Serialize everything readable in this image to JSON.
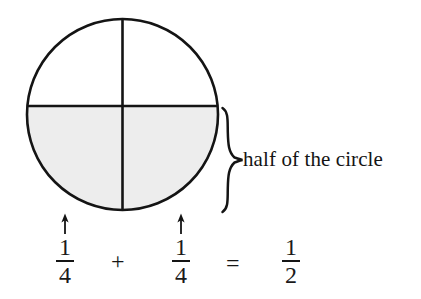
{
  "figure": {
    "type": "fraction-circle-diagram",
    "shape": "circle",
    "total_parts": 4,
    "shaded_parts": 2,
    "divider_lines": [
      "vertical-diameter",
      "horizontal-diameter"
    ],
    "shaded_region": "bottom-half",
    "shade_color": "#ededed",
    "stroke_color": "#141414"
  },
  "brace": {
    "orientation": "right-pointing",
    "label": "half of the circle"
  },
  "equation": {
    "terms": [
      {
        "id": "term-1",
        "numerator": "1",
        "denominator": "4",
        "has_arrow": true
      },
      {
        "id": "term-2",
        "numerator": "1",
        "denominator": "4",
        "has_arrow": true
      },
      {
        "id": "term-3",
        "numerator": "1",
        "denominator": "2",
        "has_arrow": false
      }
    ],
    "operators": {
      "plus": "+",
      "equals": "="
    },
    "plain_text": "1/4 + 1/4 = 1/2"
  },
  "colors": {
    "background": "#ffffff",
    "ink": "#141414",
    "shade": "#ededed"
  }
}
